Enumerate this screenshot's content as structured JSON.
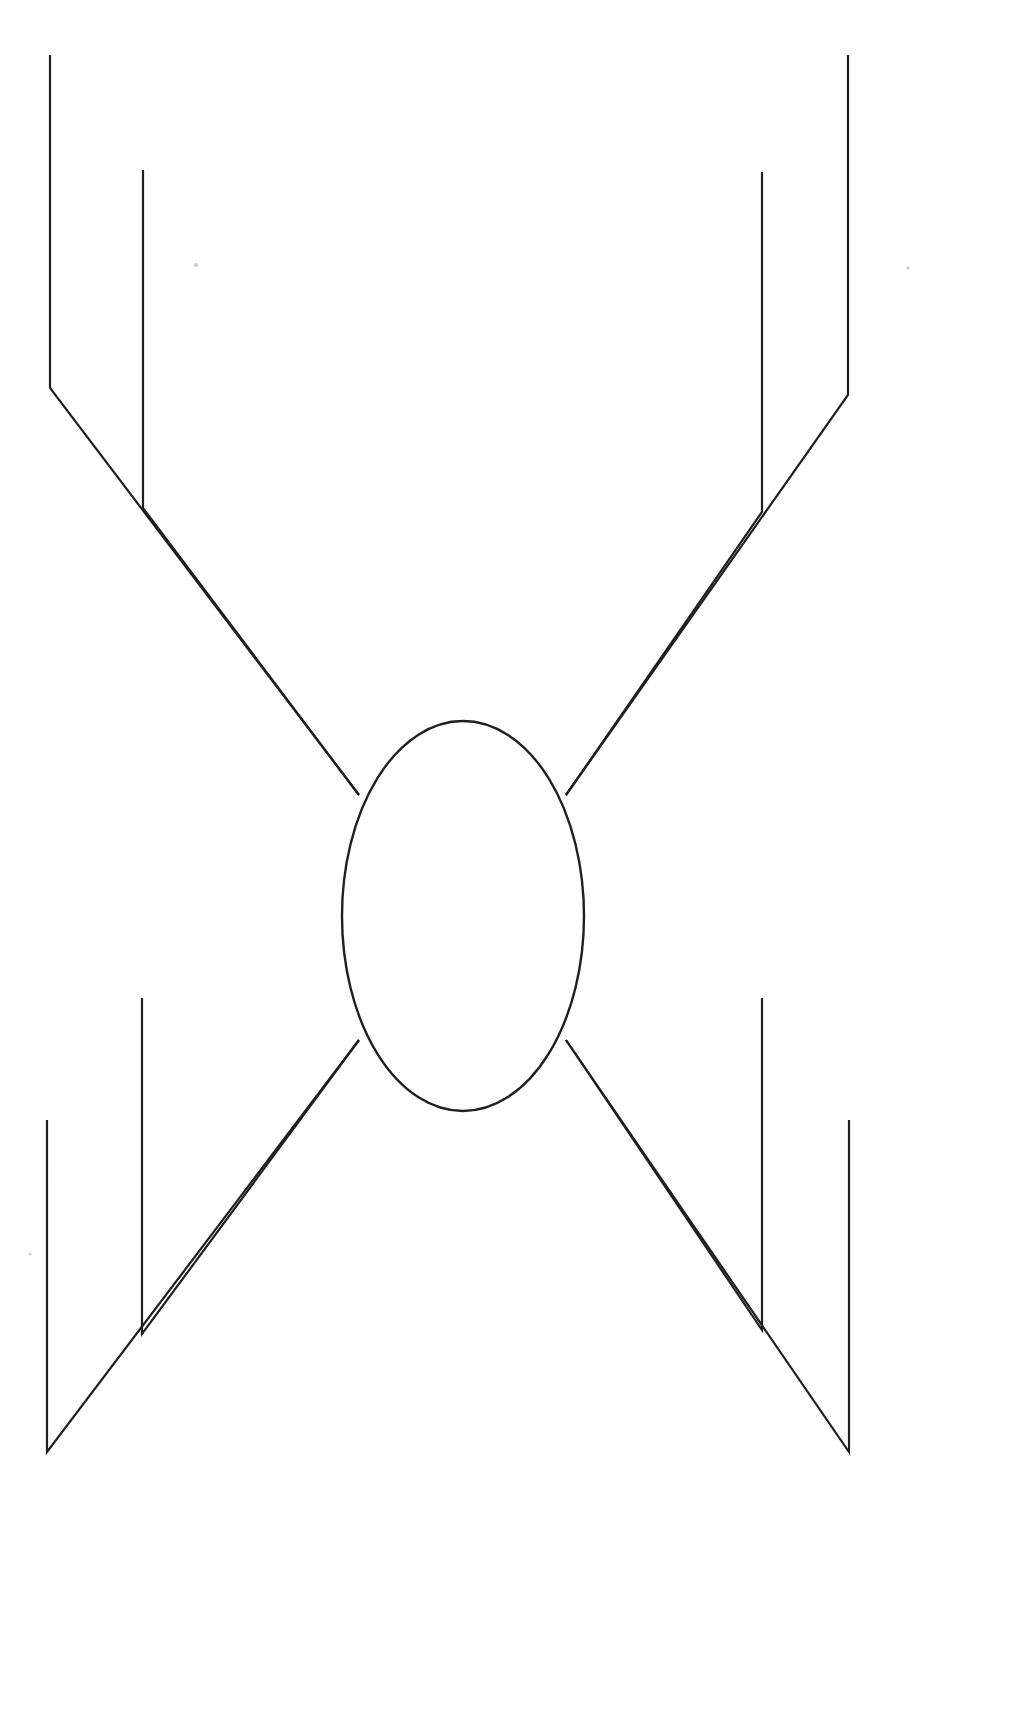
{
  "document": {
    "title": "Feynman-style line diagram",
    "background_color": "#ffffff",
    "stroke_color": "#1f1f1f",
    "canvas": {
      "width": 1010,
      "height": 1734
    }
  },
  "figure": {
    "name": "four-leg-blob-diagram",
    "blob": {
      "label": "central-ellipse",
      "cx": 463,
      "cy": 916,
      "rx": 121,
      "ry": 195
    },
    "legs": [
      {
        "name": "top-left-outer-leg",
        "vertical": {
          "x": 50,
          "y_top": 55,
          "y_bottom": 388
        },
        "diagonal": {
          "x1": 50,
          "y1": 388,
          "x2": 359,
          "y2": 795
        }
      },
      {
        "name": "top-left-inner-leg",
        "vertical": {
          "x": 143,
          "y_top": 170,
          "y_bottom": 508
        },
        "diagonal": {
          "x1": 143,
          "y1": 508,
          "x2": 359,
          "y2": 795
        }
      },
      {
        "name": "top-right-outer-leg",
        "vertical": {
          "x": 848,
          "y_top": 55,
          "y_bottom": 395
        },
        "diagonal": {
          "x1": 848,
          "y1": 395,
          "x2": 566,
          "y2": 795
        }
      },
      {
        "name": "top-right-inner-leg",
        "vertical": {
          "x": 762,
          "y_top": 172,
          "y_bottom": 512
        },
        "diagonal": {
          "x1": 762,
          "y1": 512,
          "x2": 566,
          "y2": 795
        }
      },
      {
        "name": "bottom-left-outer-leg",
        "vertical": {
          "x": 47,
          "y_top": 1120,
          "y_bottom": 1452
        },
        "diagonal": {
          "x1": 47,
          "y1": 1452,
          "x2": 359,
          "y2": 1040
        }
      },
      {
        "name": "bottom-left-inner-leg",
        "vertical": {
          "x": 142,
          "y_top": 998,
          "y_bottom": 1334
        },
        "diagonal": {
          "x1": 142,
          "y1": 1334,
          "x2": 359,
          "y2": 1040
        }
      },
      {
        "name": "bottom-right-outer-leg",
        "vertical": {
          "x": 849,
          "y_top": 1120,
          "y_bottom": 1452
        },
        "diagonal": {
          "x1": 849,
          "y1": 1452,
          "x2": 566,
          "y2": 1040
        }
      },
      {
        "name": "bottom-right-inner-leg",
        "vertical": {
          "x": 762,
          "y_top": 998,
          "y_bottom": 1330
        },
        "diagonal": {
          "x1": 762,
          "y1": 1330,
          "x2": 566,
          "y2": 1040
        }
      }
    ],
    "specks": [
      {
        "name": "scan-speck-upper-left",
        "cx": 196,
        "cy": 265,
        "r": 2.0
      },
      {
        "name": "scan-speck-upper-right",
        "cx": 908,
        "cy": 268,
        "r": 1.6
      },
      {
        "name": "scan-speck-lower-left",
        "cx": 30,
        "cy": 1254,
        "r": 1.4
      }
    ]
  }
}
